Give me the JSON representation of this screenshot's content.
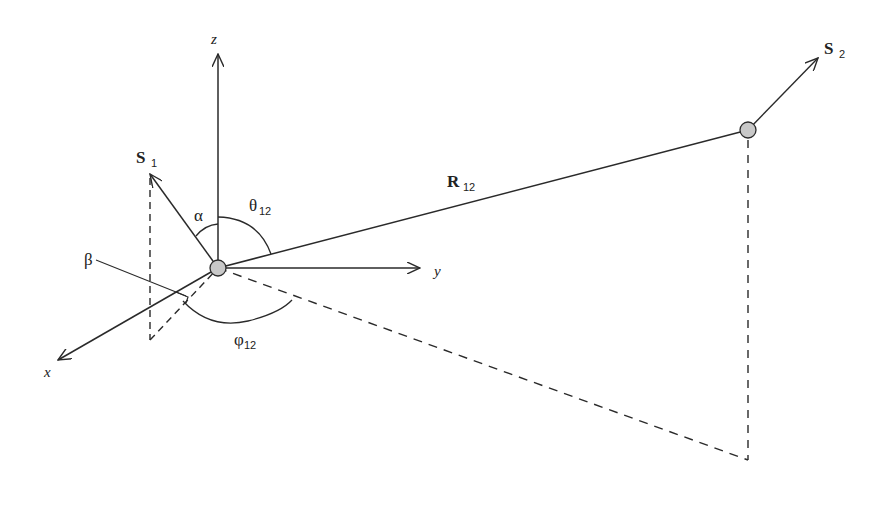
{
  "diagram": {
    "axes": {
      "x": "x",
      "y": "y",
      "z": "z"
    },
    "vectors": {
      "s1": {
        "base": "S",
        "subscript": "1"
      },
      "s2": {
        "base": "S",
        "subscript": "2"
      },
      "r12": {
        "base": "R",
        "subscript": "12"
      }
    },
    "angles": {
      "alpha": "α",
      "beta": "β",
      "theta12": {
        "base": "θ",
        "subscript": "12"
      },
      "phi12": {
        "base": "φ",
        "subscript": "12"
      }
    },
    "colors": {
      "line": "#2a2a2a",
      "particle_fill": "#c8c8c8",
      "background": "#ffffff"
    }
  }
}
